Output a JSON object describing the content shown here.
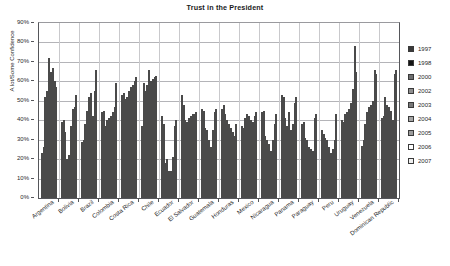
{
  "chart_data": {
    "type": "bar",
    "title": "Trust in the President",
    "xlabel": "",
    "ylabel": "A lot/Some Confidence",
    "ylim": [
      0,
      90
    ],
    "y_tick_labels": [
      "0%",
      "10%",
      "20%",
      "30%",
      "40%",
      "50%",
      "60%",
      "70%",
      "80%",
      "90%"
    ],
    "y_tick_values": [
      0,
      10,
      20,
      30,
      40,
      50,
      60,
      70,
      80,
      90
    ],
    "grid": true,
    "legend_position": "right",
    "categories": [
      "Argentina",
      "Bolivia",
      "Brazil",
      "Colombia",
      "Costa Rica",
      "Chile",
      "Ecuador",
      "El Salvador",
      "Guatemala",
      "Honduras",
      "Mexico",
      "Nicaragua",
      "Panama",
      "Paraguay",
      "Peru",
      "Uruguay",
      "Venezuela",
      "Dominican Republic"
    ],
    "series": [
      {
        "name": "1997",
        "color": "#3a3a3a",
        "values": [
          23,
          39,
          29,
          44,
          53,
          37,
          42,
          53,
          46,
          46,
          37,
          44,
          53,
          38,
          35,
          40,
          27,
          41
        ]
      },
      {
        "name": "1998",
        "color": "#141414",
        "values": [
          26,
          40,
          30,
          45,
          54,
          59,
          38,
          48,
          45,
          48,
          36,
          45,
          52,
          39,
          33,
          39,
          30,
          42
        ]
      },
      {
        "name": "2000",
        "color": "#6e6e6e",
        "values": [
          52,
          34,
          38,
          37,
          51,
          55,
          18,
          40,
          36,
          43,
          41,
          32,
          41,
          31,
          31,
          43,
          38,
          52
        ]
      },
      {
        "name": "2002",
        "color": "#8f8f8f",
        "values": [
          55,
          20,
          45,
          40,
          52,
          58,
          20,
          39,
          35,
          40,
          43,
          30,
          37,
          30,
          30,
          44,
          44,
          48
        ]
      },
      {
        "name": "2003",
        "color": "#787878",
        "values": [
          72,
          22,
          52,
          41,
          55,
          66,
          14,
          41,
          30,
          38,
          42,
          28,
          44,
          26,
          26,
          46,
          47,
          47
        ]
      },
      {
        "name": "2004",
        "color": "#a6a6a6",
        "values": [
          65,
          37,
          54,
          42,
          57,
          60,
          14,
          42,
          26,
          36,
          40,
          24,
          35,
          25,
          23,
          49,
          48,
          45
        ]
      },
      {
        "name": "2005",
        "color": "#9c9c9c",
        "values": [
          67,
          46,
          42,
          44,
          58,
          61,
          21,
          43,
          35,
          34,
          39,
          30,
          38,
          24,
          25,
          56,
          50,
          40
        ]
      },
      {
        "name": "2006",
        "color": "#ffffff",
        "values": [
          60,
          47,
          55,
          47,
          60,
          62,
          37,
          43,
          44,
          32,
          42,
          38,
          49,
          41,
          30,
          78,
          66,
          64
        ]
      },
      {
        "name": "2007",
        "color": "#f0f0f0",
        "values": [
          57,
          53,
          66,
          59,
          62,
          63,
          40,
          44,
          46,
          38,
          44,
          43,
          52,
          43,
          43,
          65,
          64,
          66
        ]
      }
    ]
  }
}
